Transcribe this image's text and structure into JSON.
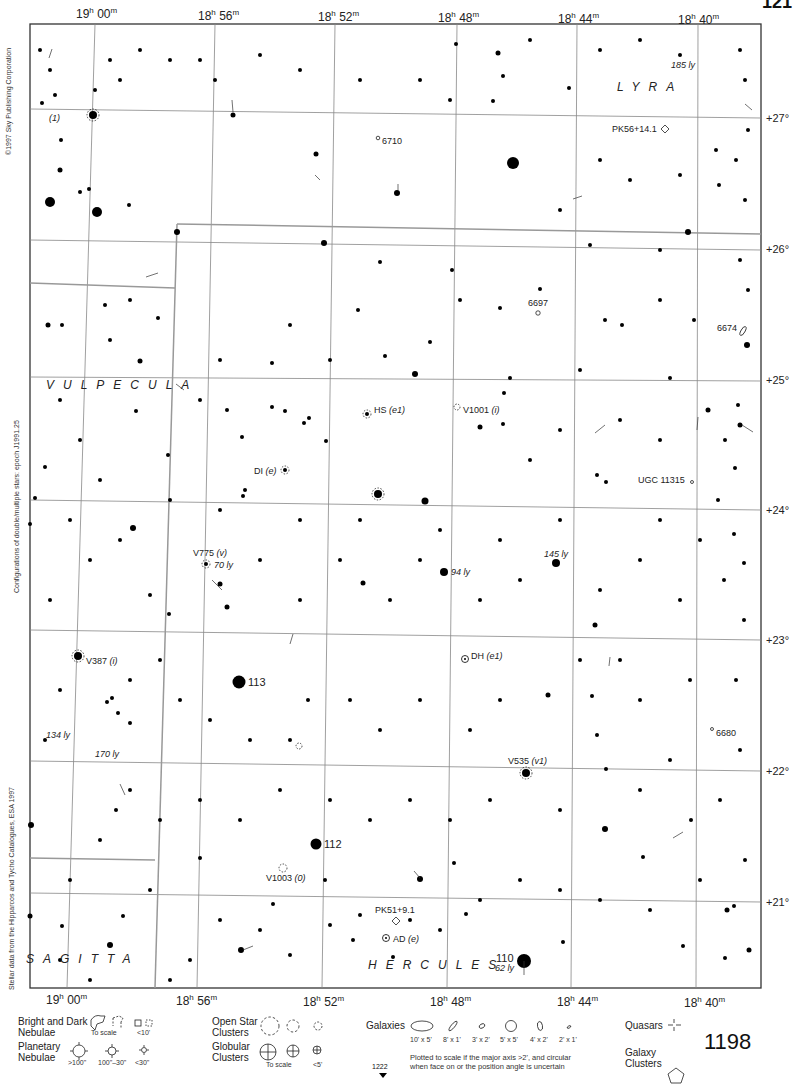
{
  "atlas": {
    "page_number": "1198",
    "adjacent_page_top": "121",
    "adjacent_page_bottom": "1222",
    "copyright": "©1997 Sky Publishing Corporation",
    "epoch_note": "Configurations of double/multiple stars: epoch J1991.25",
    "data_source": "Stellar data from the Hipparcos and Tycho Catalogues, ESA 1997"
  },
  "axes": {
    "ra_top": [
      {
        "h": "19",
        "m": "00",
        "x": 76
      },
      {
        "h": "18",
        "m": "56",
        "x": 198
      },
      {
        "h": "18",
        "m": "52",
        "x": 318
      },
      {
        "h": "18",
        "m": "48",
        "x": 438
      },
      {
        "h": "18",
        "m": "44",
        "x": 558
      },
      {
        "h": "18",
        "m": "40",
        "x": 678
      }
    ],
    "ra_bottom": [
      {
        "h": "19",
        "m": "00",
        "x": 46
      },
      {
        "h": "18",
        "m": "56",
        "x": 176
      },
      {
        "h": "18",
        "m": "52",
        "x": 303
      },
      {
        "h": "18",
        "m": "48",
        "x": 430
      },
      {
        "h": "18",
        "m": "44",
        "x": 557
      },
      {
        "h": "18",
        "m": "40",
        "x": 684
      }
    ],
    "dec": [
      {
        "label": "+27°",
        "y": 118
      },
      {
        "label": "+26°",
        "y": 250
      },
      {
        "label": "+25°",
        "y": 381
      },
      {
        "label": "+24°",
        "y": 510
      },
      {
        "label": "+23°",
        "y": 640
      },
      {
        "label": "+22°",
        "y": 771
      },
      {
        "label": "+21°",
        "y": 902
      }
    ]
  },
  "constellations": [
    {
      "name": "LYRA",
      "x": 617,
      "y": 80
    },
    {
      "name": "VULPECULA",
      "x": 46,
      "y": 382
    },
    {
      "name": "HERCULES",
      "x": 368,
      "y": 962
    },
    {
      "name": "SAGITTA",
      "x": 26,
      "y": 956
    }
  ],
  "objects": [
    {
      "label": "6710",
      "type": "galaxy",
      "x": 380,
      "y": 138
    },
    {
      "label": "PK56+14.1",
      "type": "planetary-nebula",
      "x": 612,
      "y": 124
    },
    {
      "label": "6697",
      "type": "galaxy",
      "x": 528,
      "y": 300
    },
    {
      "label": "6674",
      "type": "galaxy",
      "x": 717,
      "y": 325
    },
    {
      "label": "HS",
      "var": "(e1)",
      "type": "variable-star",
      "x": 374,
      "y": 405
    },
    {
      "label": "V1001",
      "var": "(i)",
      "type": "variable-star",
      "x": 463,
      "y": 405
    },
    {
      "label": "DI",
      "var": "(e)",
      "type": "variable-star",
      "x": 254,
      "y": 466
    },
    {
      "label": "UGC 11315",
      "type": "galaxy",
      "x": 638,
      "y": 475
    },
    {
      "label": "V775",
      "var": "(v)",
      "type": "variable-star",
      "x": 193,
      "y": 548
    },
    {
      "label": "DH",
      "var": "(e1)",
      "type": "variable-star",
      "x": 471,
      "y": 652
    },
    {
      "label": "113",
      "type": "flamsteed-star",
      "x": 248,
      "y": 677
    },
    {
      "label": "V387",
      "var": "(i)",
      "type": "variable-star",
      "x": 86,
      "y": 656
    },
    {
      "label": "6680",
      "type": "galaxy",
      "x": 716,
      "y": 729
    },
    {
      "label": "V535",
      "var": "(v1)",
      "type": "variable-star",
      "x": 508,
      "y": 757
    },
    {
      "label": "112",
      "type": "flamsteed-star",
      "x": 324,
      "y": 838
    },
    {
      "label": "V1003",
      "var": "(0)",
      "type": "variable-star",
      "x": 266,
      "y": 873
    },
    {
      "label": "PK51+9.1",
      "type": "planetary-nebula",
      "x": 375,
      "y": 905
    },
    {
      "label": "AD",
      "var": "(e)",
      "type": "variable-star",
      "x": 393,
      "y": 935
    },
    {
      "label": "110",
      "type": "flamsteed-star",
      "x": 496,
      "y": 954
    },
    {
      "label": "(1)",
      "type": "double-star",
      "x": 49,
      "y": 118
    }
  ],
  "distances": [
    {
      "label": "185 ly",
      "x": 671,
      "y": 60
    },
    {
      "label": "70 ly",
      "x": 214,
      "y": 562
    },
    {
      "label": "94 ly",
      "x": 451,
      "y": 569
    },
    {
      "label": "145 ly",
      "x": 544,
      "y": 550
    },
    {
      "label": "134 ly",
      "x": 46,
      "y": 730
    },
    {
      "label": "170 ly",
      "x": 95,
      "y": 749
    },
    {
      "label": "62 ly",
      "x": 495,
      "y": 963
    }
  ],
  "legend": {
    "nebulae": {
      "title": "Bright and Dark Nebulae",
      "to_scale": "To scale",
      "small": "<10'"
    },
    "planetary": {
      "title": "Planetary Nebulae",
      "sizes": [
        ">100\"",
        "100\"–30\"",
        "<30\""
      ]
    },
    "open_clusters": {
      "title": "Open Star Clusters"
    },
    "globular": {
      "title": "Globular Clusters",
      "to_scale": "To scale",
      "small": "<5'"
    },
    "galaxies": {
      "title": "Galaxies",
      "sizes": [
        "10' x 5'",
        "8' x 1'",
        "3' x 2'",
        "5' x 5'",
        "4' x 2'",
        "2' x 1'"
      ],
      "note_line1": "Plotted to scale if the major axis >2', and circular",
      "note_line2": "when face on or the position angle is uncertain"
    },
    "quasars": {
      "title": "Quasars"
    },
    "galaxy_clusters": {
      "title": "Galaxy Clusters"
    }
  }
}
